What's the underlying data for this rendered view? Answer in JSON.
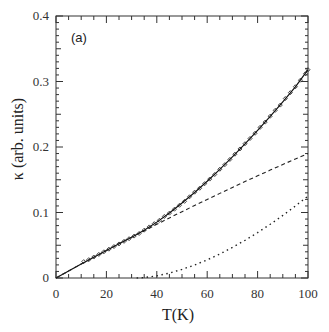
{
  "panel_label": "(a)",
  "chart_data": {
    "type": "line",
    "title": "",
    "panel": "(a)",
    "xlabel": "T(K)",
    "ylabel": "κ (arb. units)",
    "xlim": [
      0,
      100
    ],
    "ylim": [
      0,
      0.4
    ],
    "x_ticks": [
      0,
      20,
      40,
      60,
      80,
      100
    ],
    "x_tick_labels": [
      "0",
      "20",
      "40",
      "60",
      "80",
      "100"
    ],
    "y_ticks": [
      0,
      0.1,
      0.2,
      0.3,
      0.4
    ],
    "y_tick_labels": [
      "0",
      "0.1",
      "0.2",
      "0.3",
      "0.4"
    ],
    "grid": false,
    "legend": null,
    "series": [
      {
        "name": "measured",
        "style": "markers",
        "color": "#333333",
        "x": [
          11,
          13,
          15,
          17,
          19,
          21,
          23,
          25,
          27,
          29,
          31,
          33,
          35,
          37,
          39,
          41,
          43,
          45,
          47,
          49,
          51,
          53,
          55,
          57,
          59,
          61,
          63,
          65,
          67,
          69,
          71,
          73,
          75,
          77,
          79,
          81,
          83,
          85,
          87,
          89,
          91,
          93,
          95,
          97,
          99,
          100
        ],
        "values": [
          0.025,
          0.028,
          0.032,
          0.036,
          0.04,
          0.044,
          0.048,
          0.052,
          0.056,
          0.06,
          0.064,
          0.068,
          0.073,
          0.078,
          0.083,
          0.088,
          0.094,
          0.099,
          0.105,
          0.111,
          0.117,
          0.124,
          0.131,
          0.137,
          0.144,
          0.151,
          0.158,
          0.166,
          0.173,
          0.181,
          0.189,
          0.197,
          0.205,
          0.213,
          0.221,
          0.23,
          0.238,
          0.247,
          0.256,
          0.264,
          0.274,
          0.283,
          0.292,
          0.302,
          0.312,
          0.318
        ]
      },
      {
        "name": "total fit",
        "style": "solid",
        "color": "#111111",
        "x": [
          0,
          5,
          10,
          15,
          20,
          25,
          30,
          35,
          40,
          45,
          50,
          55,
          60,
          65,
          70,
          75,
          80,
          85,
          90,
          95,
          100
        ],
        "values": [
          0,
          0.0107,
          0.0213,
          0.0317,
          0.042,
          0.0522,
          0.0623,
          0.0728,
          0.0853,
          0.0992,
          0.1144,
          0.1305,
          0.1477,
          0.1658,
          0.1849,
          0.2047,
          0.2253,
          0.2467,
          0.2688,
          0.2917,
          0.318
        ]
      },
      {
        "name": "contribution 1",
        "style": "dashed",
        "color": "#222222",
        "x": [
          0,
          5,
          10,
          15,
          20,
          25,
          30,
          35,
          40,
          45,
          50,
          55,
          60,
          65,
          70,
          75,
          80,
          85,
          90,
          95,
          100
        ],
        "values": [
          0,
          0.0107,
          0.0213,
          0.0317,
          0.042,
          0.0522,
          0.0623,
          0.0722,
          0.082,
          0.0917,
          0.1013,
          0.1107,
          0.12,
          0.1292,
          0.1383,
          0.1472,
          0.156,
          0.1647,
          0.1733,
          0.1817,
          0.19
        ]
      },
      {
        "name": "contribution 2",
        "style": "dotted",
        "color": "#222222",
        "x": [
          32,
          35,
          40,
          45,
          50,
          55,
          60,
          65,
          70,
          75,
          80,
          85,
          90,
          95,
          100
        ],
        "values": [
          0,
          0.0006,
          0.0033,
          0.0075,
          0.0131,
          0.0198,
          0.0277,
          0.0366,
          0.0466,
          0.0575,
          0.0693,
          0.082,
          0.0955,
          0.11,
          0.125
        ]
      }
    ]
  }
}
